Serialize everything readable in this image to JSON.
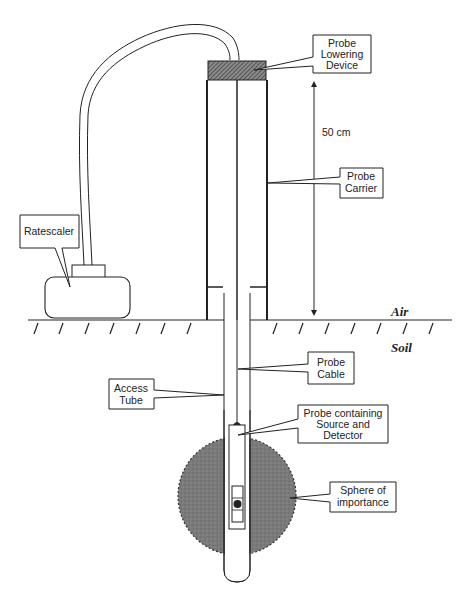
{
  "diagram": {
    "labels": {
      "probe_lowering_device": [
        "Probe",
        "Lowering",
        "Device"
      ],
      "distance": "50 cm",
      "probe_carrier": [
        "Probe",
        "Carrier"
      ],
      "ratescaler": "Ratescaler",
      "air": "Air",
      "soil": "Soil",
      "probe_cable": [
        "Probe",
        "Cable"
      ],
      "access_tube": [
        "Access",
        "Tube"
      ],
      "probe_source_detector": [
        "Probe containing",
        "Source and",
        "Detector"
      ],
      "sphere": [
        "Sphere of",
        "importance"
      ]
    },
    "colors": {
      "line": "#222222",
      "hatch_fill": "#555555",
      "sphere_fill": "#7a7a7a",
      "background": "#ffffff"
    }
  }
}
